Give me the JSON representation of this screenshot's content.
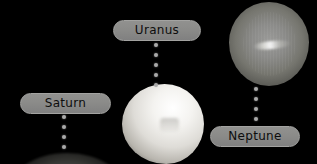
{
  "scene": {
    "title": "Outer planets labeled diagram",
    "background_color": "#000000",
    "pill_color": "#8b8b89",
    "pill_border_color": "#a3a3a1",
    "pill_text_color": "#0d0d0d",
    "dot_color": "#a9a9a9"
  },
  "labels": {
    "saturn": "Saturn",
    "uranus": "Uranus",
    "neptune": "Neptune"
  },
  "planets": [
    {
      "name": "Uranus",
      "appearance": "bright near-white sphere",
      "dominant_color": "#f4f3f0"
    },
    {
      "name": "Neptune",
      "appearance": "gray sphere with bright equatorial streak",
      "dominant_color": "#8b8b89"
    },
    {
      "name": "Saturn",
      "appearance": "faint sphere limb at bottom edge",
      "dominant_color": "#9b9993"
    }
  ],
  "connectors": {
    "uranus_dots": 5,
    "saturn_dots": 4,
    "neptune_dots": 4
  }
}
